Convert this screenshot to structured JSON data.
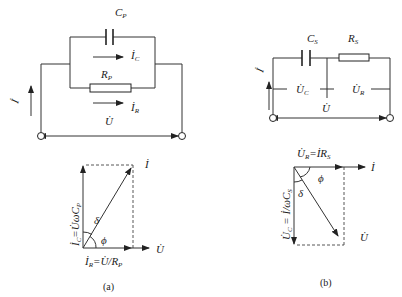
{
  "figure": {
    "panel_a": {
      "caption": "(a)",
      "circuit": {
        "capacitor_label": "C",
        "capacitor_sub": "P",
        "resistor_label": "R",
        "resistor_sub": "P",
        "current_c_label": "İ",
        "current_c_sub": "C",
        "current_r_label": "İ",
        "current_r_sub": "R",
        "total_current_label": "İ",
        "voltage_label": "U̇"
      },
      "phasor": {
        "vertical_label": "İ",
        "vertical_sub": "C",
        "vertical_expr": "=U̇ωC",
        "vertical_expr_sub": "P",
        "horizontal_label": "İ",
        "horizontal_sub": "R",
        "horizontal_expr": "=U̇/R",
        "horizontal_expr_sub": "P",
        "resultant_label": "İ",
        "reference_label": "U̇",
        "delta_label": "δ",
        "phi_label": "ϕ"
      }
    },
    "panel_b": {
      "caption": "(b)",
      "circuit": {
        "capacitor_label": "C",
        "capacitor_sub": "S",
        "resistor_label": "R",
        "resistor_sub": "S",
        "voltage_c_label": "U̇",
        "voltage_c_sub": "C",
        "voltage_r_label": "U̇",
        "voltage_r_sub": "R",
        "voltage_label": "U̇",
        "total_current_label": "İ"
      },
      "phasor": {
        "horizontal_label": "U̇",
        "horizontal_sub": "R",
        "horizontal_expr": "=İR",
        "horizontal_expr_sub": "S",
        "vertical_label": "U̇",
        "vertical_sub": "C",
        "vertical_expr": " = İ/ωC",
        "vertical_expr_sub": "S",
        "reference_label": "İ",
        "resultant_label": "U̇",
        "delta_label": "δ",
        "phi_label": "ϕ"
      }
    }
  }
}
